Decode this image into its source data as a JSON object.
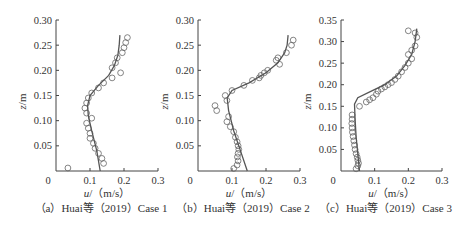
{
  "chart_data": [
    {
      "type": "scatter",
      "panel": "a",
      "caption": "（a）Huai等（2019）Case 1",
      "xlabel_var": "u",
      "xlabel_unit": "/（m/s）",
      "ylabel_var": "z",
      "ylabel_unit": "/m",
      "xlim": [
        0,
        0.3
      ],
      "ylim": [
        0,
        0.3
      ],
      "xticks": [
        "0",
        "0.1",
        "0.2",
        "0.3"
      ],
      "yticks": [
        "0.05",
        "0.10",
        "0.15",
        "0.20",
        "0.25",
        "0.30"
      ],
      "ytick_values": [
        0.05,
        0.1,
        0.15,
        0.2,
        0.25,
        0.3
      ],
      "px": {
        "x0": 56,
        "x1": 158,
        "y0": 171,
        "y1": 20
      },
      "series": [
        {
          "name": "measured",
          "style": "circle",
          "points": [
            [
              0.035,
              0.006
            ],
            [
              0.14,
              0.015
            ],
            [
              0.135,
              0.025
            ],
            [
              0.125,
              0.035
            ],
            [
              0.115,
              0.045
            ],
            [
              0.11,
              0.055
            ],
            [
              0.1,
              0.065
            ],
            [
              0.1,
              0.075
            ],
            [
              0.095,
              0.085
            ],
            [
              0.09,
              0.095
            ],
            [
              0.105,
              0.105
            ],
            [
              0.09,
              0.115
            ],
            [
              0.085,
              0.125
            ],
            [
              0.09,
              0.135
            ],
            [
              0.095,
              0.145
            ],
            [
              0.105,
              0.155
            ],
            [
              0.125,
              0.165
            ],
            [
              0.14,
              0.175
            ],
            [
              0.165,
              0.185
            ],
            [
              0.19,
              0.195
            ],
            [
              0.165,
              0.205
            ],
            [
              0.175,
              0.215
            ],
            [
              0.18,
              0.225
            ],
            [
              0.195,
              0.235
            ],
            [
              0.2,
              0.245
            ],
            [
              0.205,
              0.255
            ],
            [
              0.21,
              0.265
            ]
          ]
        },
        {
          "name": "model",
          "style": "line",
          "points": [
            [
              0.13,
              0.0
            ],
            [
              0.12,
              0.04
            ],
            [
              0.105,
              0.08
            ],
            [
              0.095,
              0.11
            ],
            [
              0.093,
              0.13
            ],
            [
              0.1,
              0.15
            ],
            [
              0.125,
              0.17
            ],
            [
              0.155,
              0.19
            ],
            [
              0.172,
              0.21
            ],
            [
              0.182,
              0.23
            ],
            [
              0.186,
              0.25
            ],
            [
              0.188,
              0.27
            ]
          ]
        }
      ]
    },
    {
      "type": "scatter",
      "panel": "b",
      "caption": "（b）Huai等（2019）Case 2",
      "xlabel_var": "u",
      "xlabel_unit": "/（m/s）",
      "ylabel_var": "z",
      "ylabel_unit": "/m",
      "xlim": [
        0,
        0.3
      ],
      "ylim": [
        0,
        0.3
      ],
      "xticks": [
        "0",
        "0.1",
        "0.2",
        "0.3"
      ],
      "yticks": [
        "0.05",
        "0.10",
        "0.15",
        "0.20",
        "0.25",
        "0.30"
      ],
      "ytick_values": [
        0.05,
        0.1,
        0.15,
        0.2,
        0.25,
        0.3
      ],
      "px": {
        "x0": 198,
        "x1": 300,
        "y0": 171,
        "y1": 20
      },
      "series": [
        {
          "name": "measured",
          "style": "circle",
          "points": [
            [
              0.105,
              0.005
            ],
            [
              0.115,
              0.012
            ],
            [
              0.118,
              0.02
            ],
            [
              0.116,
              0.028
            ],
            [
              0.118,
              0.035
            ],
            [
              0.12,
              0.043
            ],
            [
              0.118,
              0.05
            ],
            [
              0.115,
              0.058
            ],
            [
              0.11,
              0.067
            ],
            [
              0.105,
              0.078
            ],
            [
              0.095,
              0.088
            ],
            [
              0.085,
              0.098
            ],
            [
              0.09,
              0.108
            ],
            [
              0.055,
              0.12
            ],
            [
              0.05,
              0.13
            ],
            [
              0.085,
              0.14
            ],
            [
              0.08,
              0.15
            ],
            [
              0.1,
              0.16
            ],
            [
              0.135,
              0.17
            ],
            [
              0.16,
              0.18
            ],
            [
              0.18,
              0.185
            ],
            [
              0.185,
              0.19
            ],
            [
              0.195,
              0.195
            ],
            [
              0.205,
              0.2
            ],
            [
              0.24,
              0.212
            ],
            [
              0.23,
              0.22
            ],
            [
              0.235,
              0.225
            ],
            [
              0.26,
              0.235
            ],
            [
              0.275,
              0.25
            ],
            [
              0.28,
              0.26
            ]
          ]
        },
        {
          "name": "model",
          "style": "line",
          "points": [
            [
              0.145,
              0.0
            ],
            [
              0.125,
              0.04
            ],
            [
              0.105,
              0.08
            ],
            [
              0.09,
              0.12
            ],
            [
              0.086,
              0.145
            ],
            [
              0.1,
              0.16
            ],
            [
              0.15,
              0.175
            ],
            [
              0.2,
              0.195
            ],
            [
              0.235,
              0.215
            ],
            [
              0.255,
              0.235
            ],
            [
              0.262,
              0.25
            ],
            [
              0.265,
              0.27
            ]
          ]
        }
      ]
    },
    {
      "type": "scatter",
      "panel": "c",
      "caption": "（c）Huai等（2019）Case 3",
      "xlabel_var": "u",
      "xlabel_unit": "/（m/s）",
      "ylabel_var": "z",
      "ylabel_unit": "/m",
      "xlim": [
        0,
        0.3
      ],
      "ylim": [
        0,
        0.35
      ],
      "xticks": [
        "0",
        "0.1",
        "0.2",
        "0.3"
      ],
      "yticks": [
        "0.05",
        "0.10",
        "0.15",
        "0.20",
        "0.25",
        "0.30",
        "0.35"
      ],
      "ytick_values": [
        0.05,
        0.1,
        0.15,
        0.2,
        0.25,
        0.3,
        0.35
      ],
      "px": {
        "x0": 341,
        "x1": 442,
        "y0": 171,
        "y1": 20
      },
      "series": [
        {
          "name": "measured",
          "style": "circle",
          "points": [
            [
              0.045,
              0.005
            ],
            [
              0.05,
              0.012
            ],
            [
              0.052,
              0.018
            ],
            [
              0.05,
              0.025
            ],
            [
              0.048,
              0.032
            ],
            [
              0.045,
              0.04
            ],
            [
              0.042,
              0.05
            ],
            [
              0.04,
              0.06
            ],
            [
              0.038,
              0.07
            ],
            [
              0.036,
              0.08
            ],
            [
              0.034,
              0.09
            ],
            [
              0.033,
              0.1
            ],
            [
              0.032,
              0.11
            ],
            [
              0.033,
              0.12
            ],
            [
              0.033,
              0.13
            ],
            [
              0.055,
              0.15
            ],
            [
              0.075,
              0.16
            ],
            [
              0.085,
              0.165
            ],
            [
              0.095,
              0.17
            ],
            [
              0.105,
              0.178
            ],
            [
              0.11,
              0.185
            ],
            [
              0.12,
              0.19
            ],
            [
              0.13,
              0.195
            ],
            [
              0.14,
              0.2
            ],
            [
              0.15,
              0.205
            ],
            [
              0.16,
              0.212
            ],
            [
              0.17,
              0.22
            ],
            [
              0.18,
              0.23
            ],
            [
              0.19,
              0.24
            ],
            [
              0.2,
              0.25
            ],
            [
              0.21,
              0.26
            ],
            [
              0.2,
              0.27
            ],
            [
              0.21,
              0.28
            ],
            [
              0.22,
              0.29
            ],
            [
              0.225,
              0.31
            ],
            [
              0.22,
              0.32
            ],
            [
              0.2,
              0.325
            ]
          ]
        },
        {
          "name": "model",
          "style": "line",
          "points": [
            [
              0.055,
              0.0
            ],
            [
              0.05,
              0.04
            ],
            [
              0.045,
              0.08
            ],
            [
              0.042,
              0.12
            ],
            [
              0.04,
              0.155
            ],
            [
              0.05,
              0.17
            ],
            [
              0.09,
              0.185
            ],
            [
              0.13,
              0.2
            ],
            [
              0.165,
              0.22
            ],
            [
              0.19,
              0.245
            ],
            [
              0.21,
              0.27
            ],
            [
              0.22,
              0.3
            ],
            [
              0.225,
              0.33
            ]
          ]
        }
      ]
    }
  ]
}
